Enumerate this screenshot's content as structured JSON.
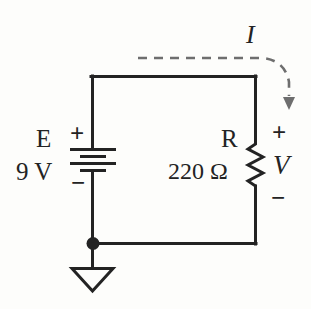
{
  "diagram": {
    "background_color": "#fdfdfb",
    "line_color": "#232323",
    "dashed_color": "#6e6e6e"
  },
  "source": {
    "symbol": "battery",
    "name": "E",
    "value": "9 V",
    "plus": "+",
    "minus": "−"
  },
  "resistor": {
    "symbol": "resistor-zigzag",
    "name": "R",
    "value": "220 Ω",
    "plus": "+",
    "minus": "−",
    "voltage_label": "V"
  },
  "current": {
    "label": "I",
    "style": "dashed-curved-arrow",
    "direction": "clockwise-down-right"
  },
  "ground": {
    "symbol": "ground-triangle",
    "node": "junction-dot"
  },
  "wires": {
    "top": "top-wire",
    "left": "left-wire",
    "right": "right-wire",
    "bottom": "bottom-wire"
  }
}
